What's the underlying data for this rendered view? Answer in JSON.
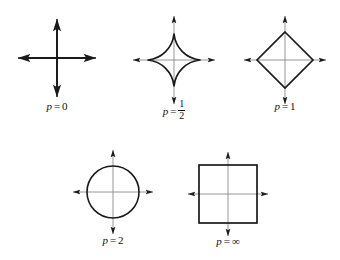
{
  "figure": {
    "background_color": "#ffffff",
    "axis_color": "#8a8a8a",
    "shape_color": "#1a1a1a",
    "arrow_color": "#1a1a1a"
  },
  "panels": [
    {
      "id": "p-0",
      "label_var": "p",
      "label_eq": "=",
      "label_value": "0",
      "shape": "cross",
      "shape_description": "two crossed thick line segments along the axes",
      "center": [
        57,
        58
      ],
      "axis_half_length": 40,
      "extent": 0
    },
    {
      "id": "p-one-half",
      "label_var": "p",
      "label_eq": "=",
      "label_value": "1/2",
      "label_numerator": "1",
      "label_denominator": "2",
      "shape": "astroid",
      "shape_description": "four-pointed star with concave sides, cusps on the axes",
      "center": [
        174,
        60
      ],
      "axis_half_length": 45,
      "extent": 28
    },
    {
      "id": "p-1",
      "label_var": "p",
      "label_eq": "=",
      "label_value": "1",
      "shape": "diamond",
      "shape_description": "square rotated 45 degrees with vertices on the axes",
      "center": [
        285,
        60
      ],
      "axis_half_length": 45,
      "extent": 28
    },
    {
      "id": "p-2",
      "label_var": "p",
      "label_eq": "=",
      "label_value": "2",
      "shape": "circle",
      "shape_description": "circle centred at the origin",
      "center": [
        113,
        192
      ],
      "axis_half_length": 42,
      "extent": 26
    },
    {
      "id": "p-infinity",
      "label_var": "p",
      "label_eq": "=",
      "label_value": "∞",
      "shape": "square",
      "shape_description": "axis-aligned square centred at the origin",
      "center": [
        228,
        194
      ],
      "axis_half_length": 42,
      "extent": 29
    }
  ]
}
